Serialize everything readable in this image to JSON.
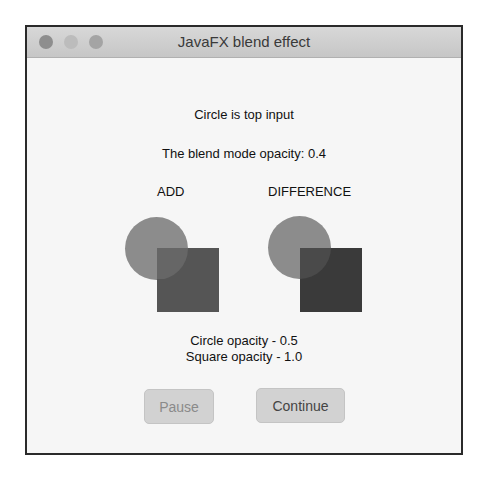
{
  "window": {
    "title": "JavaFX blend effect",
    "traffic_lights": [
      "close-icon",
      "minimize-icon",
      "maximize-icon"
    ]
  },
  "content": {
    "top_input_label": "Circle is top input",
    "blend_opacity_label": "The blend mode opacity: 0.4",
    "modes": [
      {
        "label": "ADD",
        "circle_color": "#8c8c8c",
        "square_color": "#555555",
        "overlap_color": "#666666"
      },
      {
        "label": "DIFFERENCE",
        "circle_color": "#8c8c8c",
        "square_color": "#3a3a3a",
        "overlap_color": "#4a4a4a"
      }
    ],
    "circle_opacity_label": "Circle opacity - 0.5",
    "square_opacity_label": "Square opacity - 1.0"
  },
  "buttons": {
    "pause": "Pause",
    "continue": "Continue"
  }
}
